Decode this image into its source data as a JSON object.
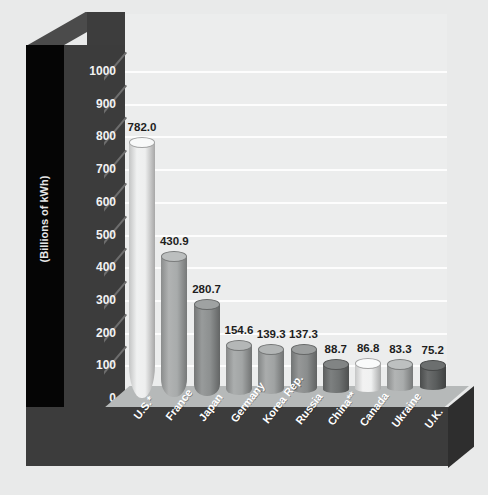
{
  "chart_data": {
    "type": "bar",
    "title": "",
    "subtitle": "",
    "xlabel": "",
    "ylabel": "(Billions of kWh)",
    "ylim": [
      0,
      1000
    ],
    "ytick_step": 100,
    "yticks": [
      "1000",
      "900",
      "800",
      "700",
      "600",
      "500",
      "400",
      "300",
      "200",
      "100",
      "0"
    ],
    "grid": true,
    "legend": "none",
    "categories": [
      "U.S.*",
      "France",
      "Japan",
      "Germany",
      "Korea Rep.",
      "Russia",
      "China**",
      "Canada",
      "Ukraine",
      "U.K."
    ],
    "values": [
      782.0,
      430.9,
      280.7,
      154.6,
      139.3,
      137.3,
      88.7,
      86.8,
      83.3,
      75.2
    ],
    "value_labels": [
      "782.0",
      "430.9",
      "280.7",
      "154.6",
      "139.3",
      "137.3",
      "88.7",
      "86.8",
      "83.3",
      "75.2"
    ],
    "bar_colors": [
      "#eeefef",
      "#a8abab",
      "#8d9090",
      "#a2a5a5",
      "#a0a3a3",
      "#8a8d8d",
      "#6f7272",
      "#f0f1f1",
      "#a9acac",
      "#5a5d5d"
    ],
    "bar_cap_colors": [
      "#f8f9f9",
      "#bcbfbf",
      "#9fa2a2",
      "#b4b7b7",
      "#b2b5b5",
      "#9b9e9e",
      "#818484",
      "#fafbfb",
      "#bdc0c0",
      "#6c6f6f"
    ]
  },
  "style": {
    "plot_background": "#eceded",
    "gridline_color": "#fdfdfd",
    "axis_wall_color": "#3c3c3c",
    "pillar_color": "#050505",
    "floor_top_color": "#b6b9b9",
    "floor_front_color": "#3c3c3c",
    "page_background": "#e9eaea",
    "tick_text_color": "#f2f2f2",
    "category_text_color": "#ffffff",
    "value_text_color": "#1e1e1e"
  }
}
